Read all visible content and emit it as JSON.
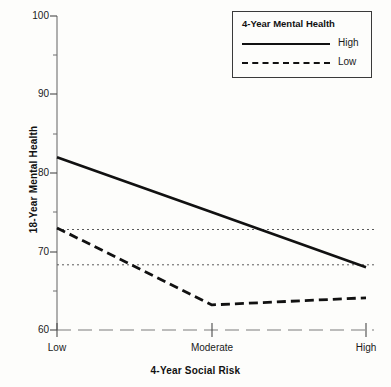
{
  "chart_data": {
    "type": "line",
    "title": "",
    "xlabel": "4-Year Social Risk",
    "ylabel": "18-Year Mental Health",
    "categories": [
      "Low",
      "Moderate",
      "High"
    ],
    "ylim": [
      60,
      100
    ],
    "yticks": [
      60,
      70,
      80,
      90,
      100
    ],
    "ytick_labels": [
      "60",
      "70",
      "80",
      "90",
      "100"
    ],
    "minor_yticks": [
      65,
      75,
      85,
      95
    ],
    "grid": false,
    "legend_position": "top-right",
    "legend_title": "4-Year Mental Health",
    "series": [
      {
        "name": "High",
        "style": "solid",
        "color": "#111111",
        "values": [
          82.0,
          75.0,
          68.0
        ]
      },
      {
        "name": "Low",
        "style": "dashed",
        "color": "#111111",
        "values": [
          73.0,
          63.2,
          64.1
        ]
      }
    ],
    "reference_lines": [
      {
        "name": "upper-reference",
        "y": 72.8,
        "style": "dotted"
      },
      {
        "name": "lower-reference",
        "y": 68.3,
        "style": "dotted"
      }
    ]
  },
  "axes": {
    "y_title": "18-Year Mental Health",
    "x_title": "4-Year Social Risk",
    "y_ticks": [
      "100",
      "90",
      "80",
      "70",
      "60"
    ],
    "x_ticks": [
      "Low",
      "Moderate",
      "High"
    ]
  },
  "legend": {
    "title": "4-Year Mental Health",
    "entries": [
      {
        "label": "High",
        "style": "solid"
      },
      {
        "label": "Low",
        "style": "dashed"
      }
    ]
  }
}
